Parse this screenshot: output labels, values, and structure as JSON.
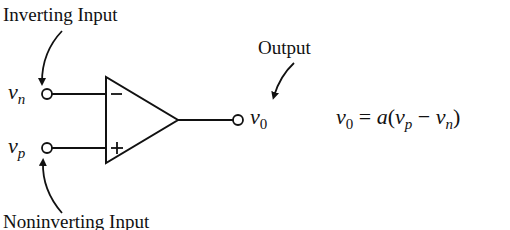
{
  "diagram": {
    "type": "op-amp symbol",
    "labels": {
      "inverting_input": "Inverting Input",
      "noninverting_input": "Noninverting Input",
      "output": "Output"
    },
    "terminals": {
      "inverting": {
        "symbol": "v",
        "subscript": "n",
        "sign": "−"
      },
      "noninverting": {
        "symbol": "v",
        "subscript": "p",
        "sign": "+"
      },
      "output": {
        "symbol": "v",
        "subscript": "0"
      }
    },
    "equation": {
      "lhs_symbol": "v",
      "lhs_subscript": "0",
      "equals": "=",
      "gain": "a",
      "open_paren": "(",
      "term1_symbol": "v",
      "term1_subscript": "p",
      "minus": "−",
      "term2_symbol": "v",
      "term2_subscript": "n",
      "close_paren": ")"
    },
    "colors": {
      "ink": "#111111",
      "background": "#ffffff"
    }
  }
}
